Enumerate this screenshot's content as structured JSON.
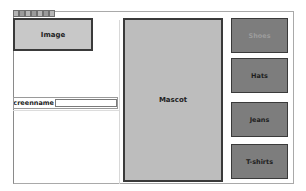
{
  "tabs": {
    "count": 7
  },
  "image_box": {
    "label": "Image"
  },
  "mascot": {
    "label": "Mascot"
  },
  "screenname": {
    "label": "screenname",
    "value": "",
    "placeholder": ""
  },
  "buttons": [
    {
      "label": "Shoes",
      "state": "disabled"
    },
    {
      "label": "Hats",
      "state": "enabled"
    },
    {
      "label": "Jeans",
      "state": "enabled"
    },
    {
      "label": "T-shirts",
      "state": "enabled"
    }
  ],
  "colors": {
    "button_bg": "#7d7d7d",
    "panel_bg": "#bdbdbd",
    "image_bg": "#c8c8c8",
    "border": "#3a3a3a"
  }
}
